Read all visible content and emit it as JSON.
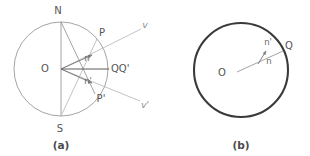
{
  "figure": {
    "background_color": "#ffffff",
    "panels": [
      {
        "id": "a",
        "caption": "(a)",
        "center_label": "O",
        "circle": {
          "cx": 61,
          "cy": 69,
          "r": 47,
          "stroke": "#9a9a9a",
          "stroke_width": 0.9
        },
        "points": [
          {
            "name": "N",
            "label": "N",
            "x": 61,
            "y": 22,
            "label_x": 58,
            "label_y": 10
          },
          {
            "name": "S",
            "label": "S",
            "x": 61,
            "y": 116,
            "label_x": 59,
            "label_y": 128
          },
          {
            "name": "O",
            "label": "O",
            "x": 61,
            "y": 69,
            "label_x": 46,
            "label_y": 69
          },
          {
            "name": "P",
            "label": "P",
            "x": 97,
            "y": 39,
            "label_x": 101,
            "label_y": 33
          },
          {
            "name": "P-prime",
            "label": "P'",
            "x": 95,
            "y": 94,
            "label_x": 99,
            "label_y": 98
          },
          {
            "name": "QQ-prime",
            "label": "QQ'",
            "x": 108,
            "y": 69,
            "label_x": 111,
            "label_y": 69
          }
        ],
        "vectors": [
          {
            "name": "n",
            "label": "n",
            "label_x": 87,
            "label_y": 59
          },
          {
            "name": "n-prime",
            "label": "n'",
            "label_x": 88,
            "label_y": 80
          }
        ],
        "rays": [
          {
            "name": "v",
            "label": "v",
            "label_x": 144,
            "label_y": 25
          },
          {
            "name": "v-prime",
            "label": "v'",
            "label_x": 144,
            "label_y": 104
          }
        ]
      },
      {
        "id": "b",
        "caption": "(b)",
        "center_label": "O",
        "circle": {
          "cx": 241,
          "cy": 70,
          "r": 47,
          "stroke": "#3a3a3a",
          "stroke_width": 2.1
        },
        "points": [
          {
            "name": "O",
            "label": "O",
            "x": 241,
            "y": 70,
            "label_x": 221,
            "label_y": 72
          },
          {
            "name": "Q",
            "label": "Q",
            "x": 285,
            "y": 50,
            "label_x": 287,
            "label_y": 45
          }
        ],
        "vectors": [
          {
            "name": "n-prime",
            "label": "n'",
            "label_x": 267,
            "label_y": 42
          },
          {
            "name": "n",
            "label": "n",
            "label_x": 268,
            "label_y": 60
          }
        ]
      }
    ]
  }
}
